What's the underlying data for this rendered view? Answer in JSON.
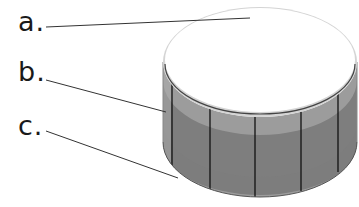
{
  "diagram": {
    "labels": [
      {
        "id": "a",
        "text": "a.",
        "points_to": "top surface"
      },
      {
        "id": "b",
        "text": "b.",
        "points_to": "side wall"
      },
      {
        "id": "c",
        "text": "c.",
        "points_to": "bottom edge"
      }
    ],
    "colors": {
      "top_face": "#ffffff",
      "top_rim": "#d8d8d8",
      "band_light": "#9a9a9a",
      "band_dark": "#7c7c7c",
      "seam_lines": "#111111",
      "leader_lines": "#333333"
    },
    "segments": 5
  }
}
